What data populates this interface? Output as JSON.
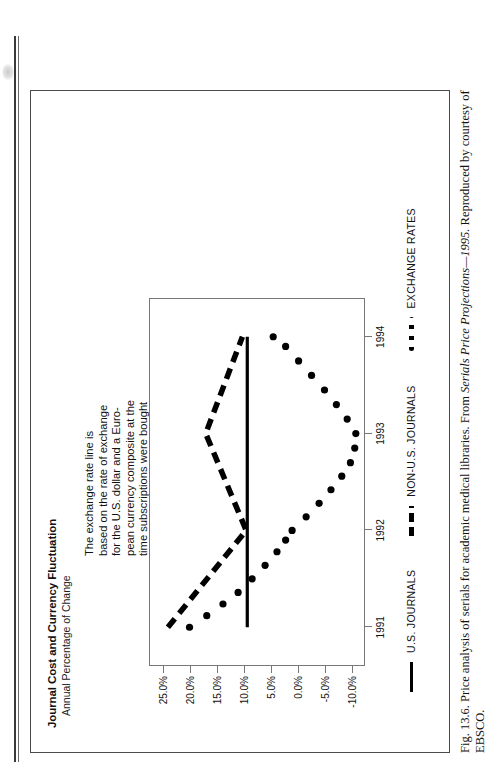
{
  "figure": {
    "title": "Journal Cost and Currency Fluctuation",
    "subtitle": "Annual Percentage of Change",
    "caption_prefix": "Fig. 13.6.",
    "caption_part1": "Price analysis of serials for academic medical libraries. From",
    "caption_italic": "Serials Price Projections—1995.",
    "caption_part2": "Reproduced by courtesy of EBSCO."
  },
  "annotation": {
    "lines": [
      "The exchange rate line is",
      "based on the rate of exchange",
      "for the U.S. dollar and a Euro-",
      "pean currency composite at the",
      "time subscriptions were bought",
      "for each year shown. The cur-",
      "rency composite is an average",
      "of values for the British pound,",
      "Dutch guilder, German mark,",
      "French franc and Swiss franc.",
      "Each point on the exchange",
      "rate line represents the change",
      "in the currency composite's",
      "value as compared to the U.S.",
      "dollar (i.e., the change in how",
      "many dollars can be bought by",
      "a unit of the currency compos-",
      "ite from one year to the next).",
      "When the line slopes down-",
      "ward, the U.S. dollar is stronger."
    ]
  },
  "legend": {
    "items": [
      {
        "label": "U.S. JOURNALS",
        "style": "solid",
        "color": "#000000"
      },
      {
        "label": "NON-U.S. JOURNALS",
        "style": "dashed",
        "color": "#000000"
      },
      {
        "label": "EXCHANGE RATES",
        "style": "dotted",
        "color": "#000000"
      }
    ]
  },
  "chart_data": {
    "type": "line",
    "title": "Journal Cost and Currency Fluctuation",
    "subtitle": "Annual Percentage of Change",
    "xlabel": "",
    "ylabel": "Annual Percentage of Change",
    "x": [
      1991,
      1992,
      1993,
      1994
    ],
    "categories": [
      "1991",
      "1992",
      "1993",
      "1994"
    ],
    "xtick_labels": [
      "1991",
      "1992",
      "1993",
      "1994"
    ],
    "ytick_labels": [
      "25.0%",
      "20.0%",
      "15.0%",
      "10.0%",
      "5.0%",
      "0.0%",
      "-5.0%",
      "-10.0%"
    ],
    "ytick_values": [
      25.0,
      20.0,
      15.0,
      10.0,
      5.0,
      0.0,
      -5.0,
      -10.0
    ],
    "ylim": [
      -12.5,
      27.5
    ],
    "xlim": [
      1990.6,
      1994.4
    ],
    "grid": false,
    "legend_position": "bottom",
    "series": [
      {
        "name": "U.S. JOURNALS",
        "style": "solid",
        "color": "#000000",
        "values": [
          9.3,
          9.3,
          9.3,
          9.3
        ]
      },
      {
        "name": "NON-U.S. JOURNALS",
        "style": "dashed",
        "color": "#000000",
        "values": [
          24.0,
          9.5,
          17.0,
          10.2
        ]
      },
      {
        "name": "EXCHANGE RATES",
        "style": "dotted",
        "color": "#000000",
        "marker": "circle",
        "values": [
          20.0,
          1.0,
          -10.8,
          4.5
        ],
        "dense_points_x": [
          1991.0,
          1991.12,
          1991.24,
          1991.36,
          1991.5,
          1991.64,
          1991.78,
          1991.9,
          1992.0,
          1992.14,
          1992.28,
          1992.42,
          1992.56,
          1992.7,
          1992.85,
          1993.0,
          1993.15,
          1993.3,
          1993.45,
          1993.6,
          1993.75,
          1993.9,
          1994.0
        ],
        "dense_points_y": [
          20.0,
          16.8,
          13.8,
          11.0,
          8.4,
          6.0,
          3.8,
          2.2,
          1.0,
          -1.6,
          -4.0,
          -6.2,
          -8.2,
          -9.8,
          -10.6,
          -10.8,
          -9.2,
          -7.2,
          -5.0,
          -2.6,
          -0.2,
          2.2,
          4.5
        ]
      }
    ]
  },
  "axis": {
    "y_labels": [
      "25.0%",
      "20.0%",
      "15.0%",
      "10.0%",
      "5.0%",
      "0.0%",
      "-5.0%",
      "-10.0%"
    ],
    "x_labels": [
      "1991",
      "1992",
      "1993",
      "1994"
    ]
  }
}
